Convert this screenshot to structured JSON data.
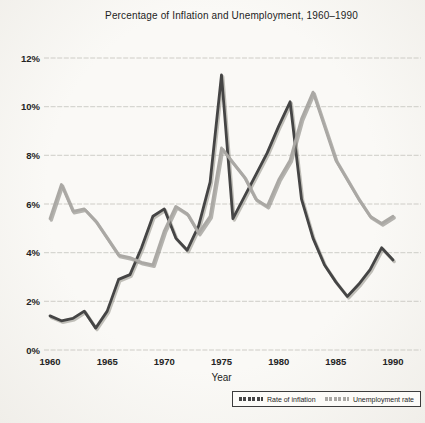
{
  "chart": {
    "title": "Percentage of Inflation and Unemployment, 1960–1990",
    "xlabel": "Year"
  },
  "chart_data": {
    "type": "line",
    "title": "Percentage of Inflation and Unemployment, 1960–1990",
    "xlabel": "Year",
    "ylabel": "",
    "grid": true,
    "legend_position": "bottom-right",
    "ylim": [
      0,
      12
    ],
    "y_ticks": {
      "values": [
        0,
        2,
        4,
        6,
        8,
        10,
        12
      ],
      "labels": [
        "0%",
        "2%",
        "4%",
        "6%",
        "8%",
        "10%",
        "12%"
      ]
    },
    "x_ticks": {
      "years": [
        1960,
        1965,
        1970,
        1975,
        1980,
        1985,
        1990
      ],
      "labels": [
        "1960",
        "1965",
        "1970",
        "1975",
        "1980",
        "1985",
        "1990"
      ]
    },
    "x": [
      1960,
      1961,
      1962,
      1963,
      1964,
      1965,
      1966,
      1967,
      1968,
      1969,
      1970,
      1971,
      1972,
      1973,
      1974,
      1975,
      1976,
      1977,
      1978,
      1979,
      1980,
      1981,
      1982,
      1983,
      1984,
      1985,
      1986,
      1987,
      1988,
      1989,
      1990
    ],
    "series": [
      {
        "name": "Rate of inflation",
        "id": "inflation",
        "color": "#454545",
        "shadow": "#9a978f",
        "values": [
          1.4,
          1.2,
          1.3,
          1.6,
          0.9,
          1.6,
          2.9,
          3.1,
          4.2,
          5.5,
          5.8,
          4.6,
          4.1,
          5.1,
          6.9,
          11.3,
          5.4,
          6.3,
          7.2,
          8.1,
          9.2,
          10.2,
          6.2,
          4.6,
          3.5,
          2.8,
          2.2,
          2.7,
          3.3,
          4.2,
          3.7
        ]
      },
      {
        "name": "Unemployment rate",
        "id": "unemployment",
        "color": "#aaa8a4",
        "shadow": "#86847e",
        "values": [
          5.4,
          6.8,
          5.7,
          5.8,
          5.3,
          4.6,
          3.9,
          3.8,
          3.6,
          3.5,
          4.9,
          5.9,
          5.6,
          4.8,
          5.5,
          8.3,
          7.7,
          7.1,
          6.2,
          5.9,
          7.0,
          7.8,
          9.5,
          10.6,
          9.2,
          7.8,
          7.0,
          6.2,
          5.5,
          5.2,
          5.5
        ]
      }
    ]
  }
}
